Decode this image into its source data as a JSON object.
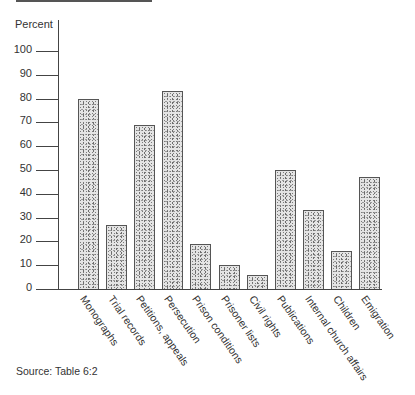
{
  "chart_data": {
    "type": "bar",
    "title": "",
    "xlabel": "",
    "ylabel": "Percent",
    "ylim": [
      0,
      100
    ],
    "yticks": [
      0,
      10,
      20,
      30,
      40,
      50,
      60,
      70,
      80,
      90,
      100
    ],
    "grid": false,
    "legend": null,
    "categories": [
      "Monographs",
      "Trial records",
      "Petitions, appeals",
      "Persecution",
      "Prison conditions",
      "Prisoner lists",
      "Civil rights",
      "Publications",
      "Internal church affairs",
      "Children",
      "Emigration"
    ],
    "values": [
      80,
      27,
      69,
      83,
      19,
      10,
      6,
      50,
      33,
      16,
      47
    ],
    "source": "Source: Table 6:2"
  }
}
